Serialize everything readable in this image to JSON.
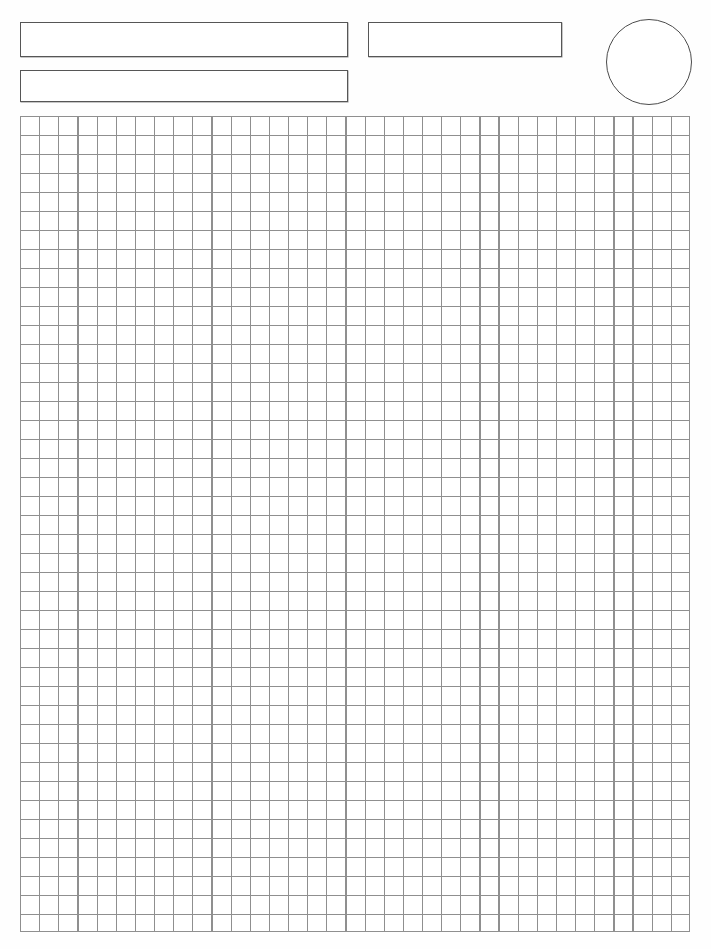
{
  "page": {
    "background_color": "#fefefe",
    "width": 711,
    "height": 949
  },
  "header": {
    "name_field": {
      "label": "name-field",
      "value": "",
      "placeholder": ""
    },
    "subject_field": {
      "label": "subject-field",
      "value": "",
      "placeholder": ""
    },
    "date_field": {
      "label": "date-field",
      "value": "",
      "placeholder": ""
    },
    "score_circle": {
      "label": "score-circle",
      "value": ""
    }
  },
  "grid": {
    "label": "graph-paper-grid",
    "columns": 35,
    "rows": 43,
    "cell_size_px": 19,
    "line_color": "#8f8f8f",
    "border_color": "#565656",
    "cell_background": "#ffffff"
  }
}
